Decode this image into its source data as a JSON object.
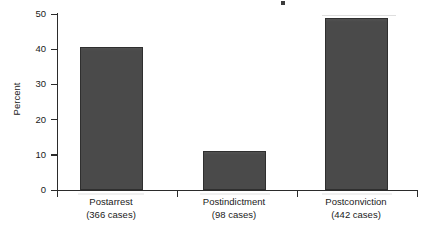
{
  "chart_data": {
    "type": "bar",
    "title": "",
    "xlabel": "",
    "ylabel": "Percent",
    "categories": [
      "Postarrest",
      "Postindictment",
      "Postconviction"
    ],
    "category_sublabels": [
      "(366 cases)",
      "(98 cases)",
      "(442 cases)"
    ],
    "case_counts": [
      366,
      98,
      442
    ],
    "values": [
      40.6,
      11.1,
      48.9
    ],
    "ylim": [
      0,
      50
    ],
    "yticks": [
      0,
      10,
      20,
      30,
      40,
      50
    ],
    "ytick_labels": [
      "0",
      "10",
      "20",
      "30",
      "40",
      "50"
    ],
    "grid": false,
    "legend": false,
    "bar_color": "#4a4a4a",
    "bar_edge_color": "#2f2f2f",
    "axis_color": "#2b2b2b",
    "background_color": "#ffffff"
  },
  "axes": {
    "y_axis_title": "Percent",
    "y_tick_labels": [
      "50",
      "40",
      "30",
      "20",
      "10",
      "0"
    ]
  },
  "bars": [
    {
      "label": "Postarrest",
      "sublabel": "(366 cases)",
      "value": 40.6
    },
    {
      "label": "Postindictment",
      "sublabel": "(98 cases)",
      "value": 11.1
    },
    {
      "label": "Postconviction",
      "sublabel": "(442 cases)",
      "value": 48.9
    }
  ]
}
